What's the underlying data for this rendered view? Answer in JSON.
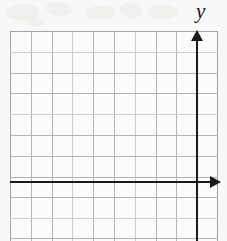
{
  "figure": {
    "kind": "coordinate-plane",
    "background_color": "#f8f8f7",
    "axis_color": "#1b1b1b",
    "gridline_color": "#b3b3b1",
    "gridline_faint_color": "#cdcdcb"
  },
  "axes": {
    "x_axis": {
      "label": "",
      "name": "x-axis",
      "arrow_direction": "right",
      "row_index_from_top": 7
    },
    "y_axis": {
      "label": "y",
      "name": "y-axis",
      "arrow_direction": "up",
      "column_index_from_left": 9
    },
    "origin": {
      "x_column": 9,
      "y_row": 7
    }
  },
  "grid": {
    "columns": 10,
    "rows": 10,
    "cell_size_px": 20.8,
    "left_px": 10,
    "top_px": 31,
    "width_px": 208,
    "height_px": 210,
    "vertical_lines": [
      0,
      20.8,
      41.6,
      62.4,
      83.2,
      104,
      124.8,
      145.6,
      166.4,
      187.2,
      207
    ],
    "horizontal_lines": [
      0,
      20.8,
      41.6,
      62.4,
      83.2,
      104,
      124.8,
      145.6,
      166.4,
      187.2,
      207
    ],
    "faint_vertical_indices": [
      3,
      6
    ],
    "faint_horizontal_indices": [
      1,
      4,
      9
    ]
  },
  "chart_data": {
    "type": "scatter",
    "title": "",
    "xlabel": "",
    "ylabel": "y",
    "x": [],
    "y": [],
    "series": [],
    "xlim": [
      -9,
      1
    ],
    "ylim": [
      -3,
      7
    ],
    "grid": true,
    "legend": "none",
    "tick_labels_x": [],
    "tick_labels_y": [],
    "annotations": []
  }
}
